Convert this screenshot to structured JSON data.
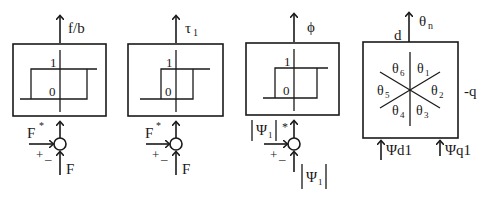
{
  "diagram": {
    "colors": {
      "stroke": "#1a1a1a",
      "background": "#ffffff"
    },
    "blocks": [
      {
        "id": "flux-hysteresis",
        "output_label": "f/b",
        "hysteresis_high": "1",
        "hysteresis_low": "0",
        "reference_label": "F",
        "reference_sup": "*",
        "feedback_label": "F",
        "sum_plus": "+",
        "sum_minus": "–"
      },
      {
        "id": "torque-hysteresis",
        "output_label": "τ",
        "output_sub": "1",
        "hysteresis_high": "1",
        "hysteresis_low": "0",
        "reference_label": "F",
        "reference_sup": "*",
        "feedback_label": "F",
        "sum_plus": "+",
        "sum_minus": "–"
      },
      {
        "id": "phi-hysteresis",
        "output_label": "ϕ",
        "hysteresis_high": "1",
        "hysteresis_low": "0",
        "reference_label": "|Ψ₁|",
        "reference_base": "Ψ",
        "reference_sub": "1",
        "reference_sup": "*",
        "feedback_base": "Ψ",
        "feedback_sub": "1",
        "sum_plus": "+",
        "sum_minus": "–"
      },
      {
        "id": "sector-selector",
        "output_label": "θ",
        "output_sub": "n",
        "axis_d": "d",
        "axis_q": "-q",
        "sectors": [
          {
            "base": "θ",
            "sub": "1"
          },
          {
            "base": "θ",
            "sub": "2"
          },
          {
            "base": "θ",
            "sub": "3"
          },
          {
            "base": "θ",
            "sub": "4"
          },
          {
            "base": "θ",
            "sub": "5"
          },
          {
            "base": "θ",
            "sub": "6"
          }
        ],
        "input_d": "Ψd1",
        "input_q": "Ψq1"
      }
    ]
  }
}
